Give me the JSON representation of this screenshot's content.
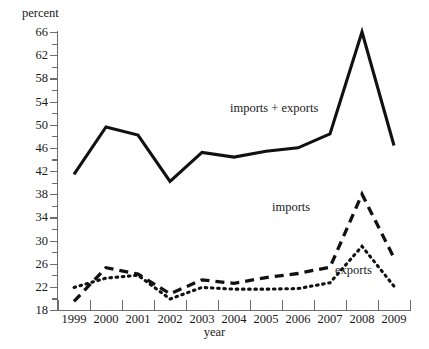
{
  "chart_data": {
    "type": "line",
    "title": "",
    "xlabel": "year",
    "ylabel": "percent",
    "x": [
      1999,
      2000,
      2001,
      2002,
      2003,
      2004,
      2005,
      2006,
      2007,
      2008,
      2009
    ],
    "categories": [
      "1999",
      "2000",
      "2001",
      "2002",
      "2003",
      "2004",
      "2005",
      "2006",
      "2007",
      "2008",
      "2009"
    ],
    "series": [
      {
        "name": "imports + exports",
        "style": "solid",
        "values": [
          41.4,
          49.6,
          48.2,
          40.2,
          45.2,
          44.4,
          45.4,
          46.0,
          48.4,
          66.0,
          46.4
        ]
      },
      {
        "name": "imports",
        "style": "dashed",
        "values": [
          19.5,
          25.3,
          24.2,
          20.8,
          23.2,
          22.6,
          23.6,
          24.3,
          25.4,
          38.0,
          27.0
        ]
      },
      {
        "name": "exports",
        "style": "dotted",
        "values": [
          21.9,
          23.5,
          24.0,
          19.9,
          21.9,
          21.6,
          21.6,
          21.7,
          22.7,
          29.0,
          22.1
        ]
      }
    ],
    "ylim": [
      18,
      66
    ],
    "xlim": [
      1999,
      2009
    ],
    "y_ticks": [
      18,
      22,
      26,
      30,
      34,
      38,
      42,
      46,
      50,
      54,
      58,
      62,
      66
    ],
    "y_tick_labels": [
      "18",
      "22",
      "26",
      "30",
      "34",
      "38",
      "42",
      "46",
      "50",
      "54",
      "58",
      "62",
      "66"
    ],
    "y_minor_tick_step": 2,
    "x_ticks": [
      "1999",
      "2000",
      "2001",
      "2002",
      "2003",
      "2004",
      "2005",
      "2006",
      "2007",
      "2008",
      "2009"
    ],
    "grid": false,
    "legend_position": "inline-annotations",
    "annotations": [
      {
        "text": "imports + exports",
        "series": "imports + exports"
      },
      {
        "text": "imports",
        "series": "imports"
      },
      {
        "text": "exports",
        "series": "exports"
      }
    ]
  }
}
